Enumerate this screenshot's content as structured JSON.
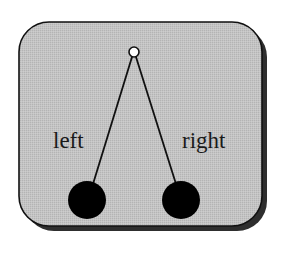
{
  "diagram": {
    "type": "pendulum-illustration",
    "colors": {
      "background": "#ffffff",
      "panel_fill": "#c2c2c2",
      "panel_border": "#111111",
      "shadow": "#2e2e2e",
      "stroke": "#111111",
      "bob_fill": "#000000",
      "pivot_fill": "#ffffff"
    },
    "panel": {
      "x": 19,
      "y": 22,
      "width": 243,
      "height": 204,
      "radius": 30,
      "shadow_offset": 5
    },
    "pivot": {
      "cx": 134,
      "cy": 52,
      "r": 5
    },
    "pendulums": [
      {
        "id": "left",
        "label": "left",
        "label_x": 53,
        "label_y": 148,
        "string_from": [
          132,
          57
        ],
        "string_to": [
          93,
          184
        ],
        "bob": {
          "cx": 87,
          "cy": 200,
          "r": 19
        }
      },
      {
        "id": "right",
        "label": "right",
        "label_x": 182,
        "label_y": 148,
        "string_from": [
          136,
          57
        ],
        "string_to": [
          176,
          184
        ],
        "bob": {
          "cx": 181,
          "cy": 200,
          "r": 19
        }
      }
    ]
  }
}
